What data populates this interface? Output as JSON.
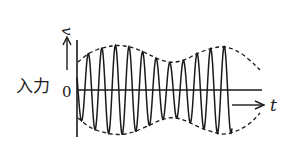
{
  "diagram": {
    "title_label": "入力",
    "zero_label": "0",
    "y_axis_label": "v",
    "x_axis_label": "t",
    "colors": {
      "stroke": "#1a1a1a",
      "background": "#ffffff"
    },
    "wave": {
      "description": "amplitude-modulated sinusoid (carrier within dashed envelope)",
      "carrier_period_px": 13.6,
      "start_x": 77,
      "end_x": 232,
      "axis_y": 90
    },
    "envelope": {
      "style": "dashed",
      "top_points": [
        [
          78,
          62
        ],
        [
          90,
          52
        ],
        [
          105,
          47
        ],
        [
          118,
          45
        ],
        [
          132,
          47
        ],
        [
          148,
          54
        ],
        [
          160,
          60
        ],
        [
          172,
          63
        ],
        [
          185,
          60
        ],
        [
          198,
          53
        ],
        [
          212,
          48
        ],
        [
          225,
          46
        ],
        [
          240,
          52
        ],
        [
          252,
          62
        ],
        [
          260,
          70
        ]
      ],
      "bottom_points": [
        [
          78,
          118
        ],
        [
          90,
          128
        ],
        [
          105,
          133
        ],
        [
          118,
          135
        ],
        [
          132,
          133
        ],
        [
          148,
          126
        ],
        [
          160,
          120
        ],
        [
          172,
          117
        ],
        [
          185,
          120
        ],
        [
          198,
          127
        ],
        [
          212,
          132
        ],
        [
          225,
          135
        ],
        [
          240,
          130
        ],
        [
          252,
          122
        ],
        [
          260,
          113
        ]
      ]
    }
  }
}
